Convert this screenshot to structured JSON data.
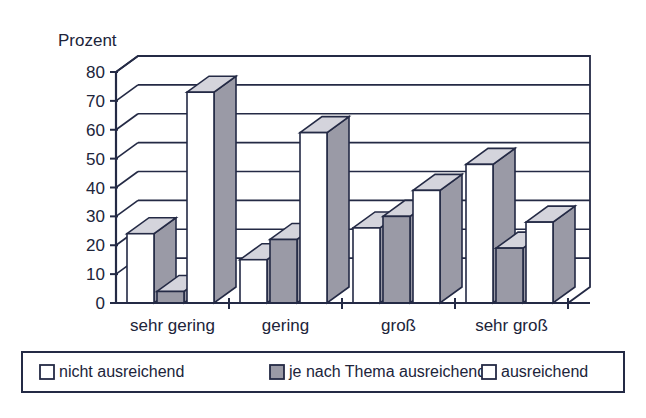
{
  "chart_data": {
    "type": "bar",
    "title": "",
    "subtitle": "",
    "ylabel": "Prozent",
    "xlabel": "",
    "categories": [
      "sehr gering",
      "gering",
      "groß",
      "sehr groß"
    ],
    "series": [
      {
        "name": "nicht ausreichend",
        "color": "#ffffff",
        "values": [
          24,
          15,
          26,
          48
        ]
      },
      {
        "name": "je nach Thema ausreichend",
        "color": "#9a9aa6",
        "values": [
          4,
          22,
          30,
          19
        ]
      },
      {
        "name": "ausreichend",
        "color": "#ffffff",
        "values": [
          73,
          59,
          39,
          28
        ]
      }
    ],
    "ylim": [
      0,
      80
    ],
    "yticks": [
      0,
      10,
      20,
      30,
      40,
      50,
      60,
      70,
      80
    ],
    "ytick_labels": [
      "0",
      "10",
      "20",
      "30",
      "40",
      "50",
      "60",
      "70",
      "80"
    ],
    "grid": true,
    "grid_axis": "y",
    "legend_position": "bottom",
    "style": "3d-bar",
    "axis_line_color": "#242a45",
    "grid_line_color": "#242a45",
    "bar_outline_color": "#242a45",
    "bar_side_color": "#9a9aa6",
    "bar_top_color": "#d4d4dc",
    "background_color": "#ffffff"
  },
  "legend": {
    "items": [
      {
        "label": "nicht ausreichend",
        "swatch": "#ffffff"
      },
      {
        "label": "je nach Thema ausreichend",
        "swatch": "#9a9aa6"
      },
      {
        "label": "ausreichend",
        "swatch": "#ffffff"
      }
    ]
  }
}
